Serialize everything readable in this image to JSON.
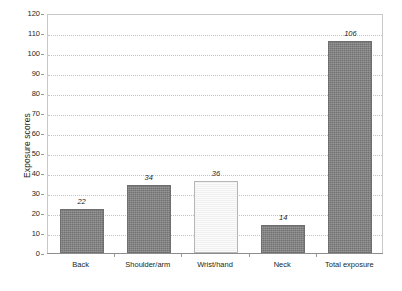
{
  "chart_data": {
    "type": "bar",
    "title": "",
    "subtitle": "",
    "xlabel": "",
    "ylabel": "Exposure scores",
    "categories": [
      "Back",
      "Shoulder/arm",
      "Wrist/hand",
      "Neck",
      "Total exposure"
    ],
    "values": [
      22,
      34,
      36,
      14,
      106
    ],
    "value_labels": [
      "22",
      "34",
      "36",
      "14",
      "106"
    ],
    "bar_colors": [
      "#808080",
      "#808080",
      "#f4f4f4",
      "#808080",
      "#808080"
    ],
    "bar_styles": [
      "filled",
      "filled",
      "open",
      "filled",
      "filled"
    ],
    "ylim": [
      0,
      120
    ],
    "ytick_step": 10,
    "yticks": [
      0,
      10,
      20,
      30,
      40,
      50,
      60,
      70,
      80,
      90,
      100,
      110,
      120
    ],
    "ytick_labels": [
      "0",
      "10",
      "20",
      "30",
      "40",
      "50",
      "60",
      "70",
      "80",
      "90",
      "100",
      "110",
      "120"
    ],
    "grid": "horizontal-dotted",
    "legend": "none",
    "legend_position": "none",
    "value_label_style": "italic",
    "frame": "box",
    "background": "#ffffff",
    "grid_color": "#c2c2c2",
    "axis_color": "#8d8d8d",
    "text_color": "#231f20"
  }
}
